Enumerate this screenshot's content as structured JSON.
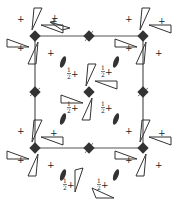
{
  "diagram": {
    "colors": {
      "line": "#555555",
      "symbol": "#333333",
      "triangle": "#333333",
      "background": "#ffffff"
    },
    "cell": {
      "x0": 35,
      "y0": 36,
      "x1": 143,
      "y1": 148
    },
    "fourbar_axes": [
      {
        "x": 35,
        "y": 36
      },
      {
        "x": 89,
        "y": 36
      },
      {
        "x": 143,
        "y": 36
      },
      {
        "x": 35,
        "y": 92
      },
      {
        "x": 89,
        "y": 92
      },
      {
        "x": 143,
        "y": 92
      },
      {
        "x": 35,
        "y": 148
      },
      {
        "x": 89,
        "y": 148
      },
      {
        "x": 143,
        "y": 148
      }
    ],
    "twofold_axes": [
      {
        "x": 63,
        "y": 62
      },
      {
        "x": 116,
        "y": 62
      },
      {
        "x": 63,
        "y": 119
      },
      {
        "x": 116,
        "y": 119
      },
      {
        "x": 63,
        "y": 175
      },
      {
        "x": 116,
        "y": 175
      }
    ],
    "labels": {
      "plus": "+",
      "half_plus_num": "1",
      "half_plus_den": "2",
      "half_plus_sign": "+"
    },
    "corner_motif_label": "+",
    "center_motif_label": "½+"
  }
}
